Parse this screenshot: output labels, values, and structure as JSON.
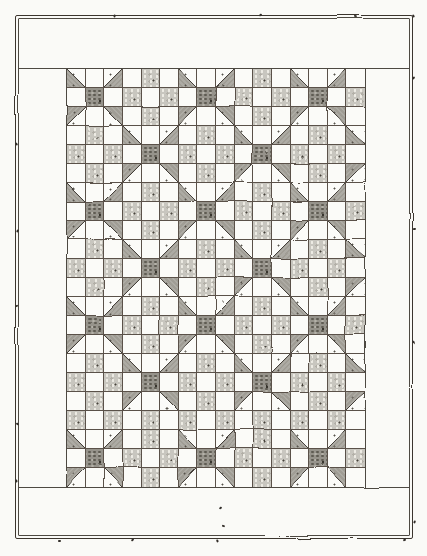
{
  "artwork": {
    "kind": "hand-drawn quilt illustration",
    "pattern_name": "shoo-fly blocks alternating with checkerboard blocks",
    "palette": {
      "paper": "#fafaf7",
      "ink": "#4e4942",
      "light_print_patch": "#c8c6bf",
      "dark_print_patch": "#96938b",
      "triangle_dark_half": "#a09d95"
    },
    "frame": {
      "outer_rect": [
        15,
        15,
        398,
        524
      ],
      "inner_rect": [
        18,
        18,
        392,
        518
      ]
    },
    "band_lines": {
      "x1": 18,
      "x2": 410,
      "top_y": 68,
      "bottom_y": 487
    },
    "grid_rect": [
      66,
      68,
      300,
      420
    ],
    "grid": {
      "cols": 16,
      "rows": 22,
      "legend": {
        "W": "white muslin patch",
        "L": "light print patch (speckled)",
        "D": "dark print patch (center of shoo-fly block)",
        "BL": "half-square triangle, dark lower-left",
        "BR": "half-square triangle, dark lower-right",
        "TL": "half-square triangle, dark upper-left",
        "TR": "half-square triangle, dark upper-right"
      },
      "cells": [
        "BL W BR W L W BL W BR W L W BL W BR W",
        "W D W L W L W D W L W L W D W L",
        "TL W TR W L W TL W TR W L W TL W TR W",
        "W L W BL W BR W L W BL W BR W L W BL",
        "L W L W D W L W L W D W L W L W",
        "W L W TL W TR W L W TL W TR W L W TL",
        "BL W BR W L W BL W BR W L W BL W BR W",
        "W D W L W L W D W L W L W D W L",
        "TL W TR W L W TL W TR W L W TL W TR W",
        "W L W BL W BR W L W BL W BR W L W BL",
        "L W L W D W L W L W D W L W L W",
        "W L W TL W TR W L W TL W TR W L W TL",
        "BL W BR W L W BL W BR W L W BL W BR W",
        "W D W L W L W D W L W L W D W L",
        "TL W TR W L W TL W TR W L W TL W TR W",
        "W L W BL W BR W L W BL W BR W L W BL",
        "L W L W D W L W L W D W L W L W",
        "W L W TL W TR W L W TL W TR W L W TL",
        "L W L W L W L W L W L W L W L W",
        "BL W BR W L W BL W BR W L W BL W BR W",
        "W D W L W L W D W L W L W D W L",
        "TL W TR W L W TL W TR W L W TL W TR W"
      ]
    },
    "stitch_marks": [
      [
        113,
        15
      ],
      [
        259,
        14
      ],
      [
        354,
        16
      ],
      [
        412,
        15
      ],
      [
        412,
        77
      ],
      [
        413,
        228
      ],
      [
        412,
        341
      ],
      [
        413,
        521
      ],
      [
        403,
        539
      ],
      [
        297,
        538
      ],
      [
        216,
        540
      ],
      [
        131,
        539
      ],
      [
        58,
        540
      ],
      [
        15,
        143
      ],
      [
        16,
        230
      ],
      [
        15,
        305
      ],
      [
        16,
        424
      ],
      [
        15,
        480
      ],
      [
        219,
        507
      ],
      [
        222,
        525
      ]
    ]
  }
}
